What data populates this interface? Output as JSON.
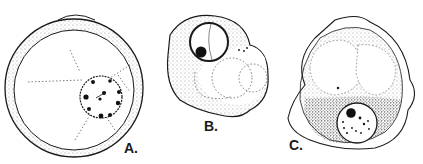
{
  "figure": {
    "panels": [
      {
        "id": "A",
        "label": "A.",
        "description": "round cell with thick granular wall, dotted radiating strands, central nucleus with dark peripheral granules"
      },
      {
        "id": "B",
        "label": "B.",
        "description": "irregular cell with granular cytoplasm, round nucleus with dark nucleolus, several dotted vacuoles"
      },
      {
        "id": "C",
        "label": "C.",
        "description": "cell within irregular outer membrane, large vacuoles above, dense granular cytoplasm below with nucleus containing nucleolus"
      }
    ],
    "colors": {
      "ink": "#1a1a1a",
      "background": "#ffffff"
    }
  }
}
